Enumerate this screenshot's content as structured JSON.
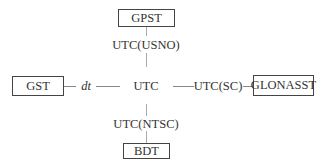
{
  "diagram": {
    "center": {
      "label": "UTC"
    },
    "nodes": [
      {
        "id": "gpst",
        "label": "GPST",
        "position": "top"
      },
      {
        "id": "gst",
        "label": "GST",
        "position": "left"
      },
      {
        "id": "glonasst",
        "label": "GLONASST",
        "position": "right"
      },
      {
        "id": "bdt",
        "label": "BDT",
        "position": "bottom"
      }
    ],
    "links": [
      {
        "from": "gpst",
        "to": "center",
        "label": "UTC(USNO)"
      },
      {
        "from": "gst",
        "to": "center",
        "label": "dt"
      },
      {
        "from": "center",
        "to": "glonasst",
        "label": "UTC(SC)"
      },
      {
        "from": "center",
        "to": "bdt",
        "label": "UTC(NTSC)"
      }
    ]
  }
}
